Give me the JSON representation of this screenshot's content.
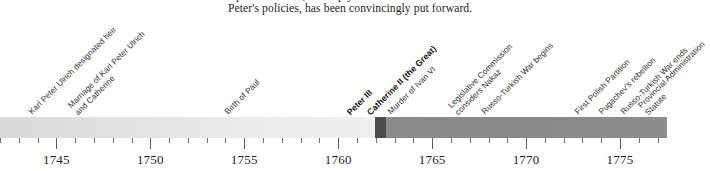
{
  "document": {
    "clipped_top_line": "a political cabal, or simply a reaction to the excesses of",
    "body_line": "Peter's policies, has been convincingly put forward."
  },
  "chart_data": {
    "type": "timeline",
    "title": "",
    "xlabel": "",
    "ylabel": "",
    "xlim": [
      1742.0,
      1777.5
    ],
    "grid": false,
    "legend_position": "none",
    "axis": {
      "tick_labels": [
        "1745",
        "1750",
        "1755",
        "1760",
        "1765",
        "1770",
        "1775"
      ],
      "tick_values": [
        1745,
        1750,
        1755,
        1760,
        1765,
        1770,
        1775
      ],
      "minor_tick_step": 1,
      "major_tick_step": 5
    },
    "reign_bands": [
      {
        "name": "Elizabeth",
        "label": "",
        "start": 1742.0,
        "end": 1761.9,
        "color": "#e4e4e3"
      },
      {
        "name": "Peter III",
        "label": "",
        "start": 1761.9,
        "end": 1762.5,
        "color": "#4c4c4c"
      },
      {
        "name": "Catherine II",
        "label": "",
        "start": 1762.5,
        "end": 1777.5,
        "color": "#8b8b8b"
      }
    ],
    "events": [
      {
        "label": "Karl Peter Ulrich designated heir",
        "year": 1742,
        "x": 34,
        "bold": false,
        "lines": [
          "Karl Peter Ulrich designated heir"
        ]
      },
      {
        "label": "Marriage of Karl Peter Ulrich and Catherine",
        "year": 1745,
        "x": 80,
        "bold": false,
        "lines": [
          "Marriage of Karl Peter Ulrich",
          "and Catherine"
        ]
      },
      {
        "label": "Birth of Paul",
        "year": 1754,
        "x": 230,
        "bold": false,
        "lines": [
          "Birth of Paul"
        ]
      },
      {
        "label": "Peter III",
        "year": 1762,
        "x": 352,
        "bold": true,
        "lines": [
          "Peter III"
        ]
      },
      {
        "label": "Catherine II (the Great)",
        "year": 1762,
        "x": 372,
        "bold": true,
        "lines": [
          "Catherine II (the Great)"
        ]
      },
      {
        "label": "Murder of Ivan VI",
        "year": 1764,
        "x": 393,
        "bold": false,
        "lines": [
          "Murder of Ivan VI"
        ]
      },
      {
        "label": "Legislative Commission considers Nakaz",
        "year": 1767,
        "x": 460,
        "bold": false,
        "lines": [
          "Legislative Commission",
          "considers Nakaz"
        ]
      },
      {
        "label": "Russo-Turkish War begins",
        "year": 1768,
        "x": 487,
        "bold": false,
        "lines": [
          "Russo-Turkish War begins"
        ]
      },
      {
        "label": "First Polish Partition",
        "year": 1772,
        "x": 580,
        "bold": false,
        "lines": [
          "First Polish Partition"
        ]
      },
      {
        "label": "Pugachev's rebellion",
        "year": 1773,
        "x": 604,
        "bold": false,
        "lines": [
          "Pugachev's rebellion"
        ]
      },
      {
        "label": "Russo-Turkish War ends",
        "year": 1774,
        "x": 626,
        "bold": false,
        "lines": [
          "Russo-Turkish War ends"
        ]
      },
      {
        "label": "Provincial Administration Statute",
        "year": 1775,
        "x": 650,
        "bold": false,
        "lines": [
          "Provincial Administration",
          "Statute"
        ]
      }
    ]
  }
}
